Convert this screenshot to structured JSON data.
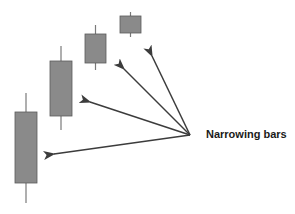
{
  "diagram": {
    "label": "Narrowing bars",
    "colors": {
      "candle_fill": "#8a8a8a",
      "candle_stroke": "#5a5a5a",
      "wick": "#7a7a7a",
      "arrow": "#3c3c3c"
    },
    "candles": [
      {
        "x": 15,
        "w": 22,
        "body_top": 112,
        "body_bottom": 183,
        "wick_top": 93,
        "wick_bottom": 203
      },
      {
        "x": 50,
        "w": 22,
        "body_top": 61,
        "body_bottom": 116,
        "wick_top": 46,
        "wick_bottom": 130
      },
      {
        "x": 85,
        "w": 21,
        "body_top": 34,
        "body_bottom": 63,
        "wick_top": 25,
        "wick_bottom": 70
      },
      {
        "x": 120,
        "w": 21,
        "body_top": 16,
        "body_bottom": 33,
        "wick_top": 12,
        "wick_bottom": 37
      }
    ],
    "arrow_origin": {
      "x": 190,
      "y": 135
    },
    "arrow_tips": [
      {
        "x": 54,
        "y": 154
      },
      {
        "x": 90,
        "y": 102
      },
      {
        "x": 124,
        "y": 69
      },
      {
        "x": 152,
        "y": 56
      }
    ]
  }
}
